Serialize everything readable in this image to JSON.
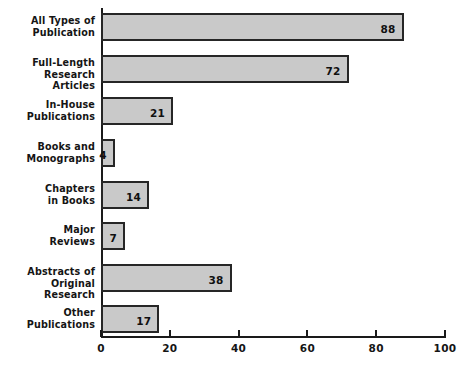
{
  "chart_data": {
    "type": "bar",
    "orientation": "horizontal",
    "title": "",
    "subtitle": "",
    "xlabel": "",
    "ylabel": "",
    "categories": [
      "All Types of Publication",
      "Full-Length Research Articles",
      "In-House Publications",
      "Books and Monographs",
      "Chapters in Books",
      "Major Reviews",
      "Abstracts of Original Research",
      "Other Publications"
    ],
    "category_lines": [
      [
        "All Types of",
        "Publication"
      ],
      [
        "Full-Length",
        "Research Articles"
      ],
      [
        "In-House",
        "Publications"
      ],
      [
        "Books and",
        "Monographs"
      ],
      [
        "Chapters",
        "in Books"
      ],
      [
        "Major",
        "Reviews"
      ],
      [
        "Abstracts of",
        "Original Research"
      ],
      [
        "Other",
        "Publications"
      ]
    ],
    "values": [
      88,
      72,
      21,
      4,
      14,
      7,
      38,
      17
    ],
    "value_labels": [
      "88",
      "72",
      "21",
      "4",
      "14",
      "7",
      "38",
      "17"
    ],
    "xlim": [
      0,
      100
    ],
    "xticks": [
      0,
      20,
      40,
      60,
      80,
      100
    ],
    "xtick_labels": [
      "0",
      "20",
      "40",
      "60",
      "80",
      "100"
    ],
    "grid": false,
    "legend": null,
    "annotations": [],
    "colors": {
      "bar_fill": "#c9c9c9",
      "bar_border": "#262626",
      "axis": "#1a1a1a",
      "text": "#151515",
      "background": "#ffffff"
    }
  }
}
